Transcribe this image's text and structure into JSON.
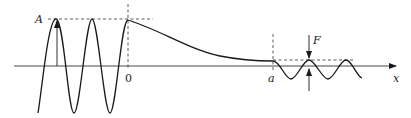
{
  "diagram": {
    "type": "wave-profile",
    "labels": {
      "amplitude": "A",
      "origin": "0",
      "point_a": "a",
      "force": "F",
      "x_axis": "x"
    },
    "colors": {
      "stroke": "#1a1a1a",
      "background": "#ffffff"
    },
    "geometry": {
      "axis_y": 66,
      "axis_x_start": 14,
      "axis_x_end": 398,
      "origin_x": 128,
      "point_a_x": 273,
      "amplitude_peak_y": 19,
      "small_peak_y": 60,
      "small_trough_y": 79
    }
  }
}
